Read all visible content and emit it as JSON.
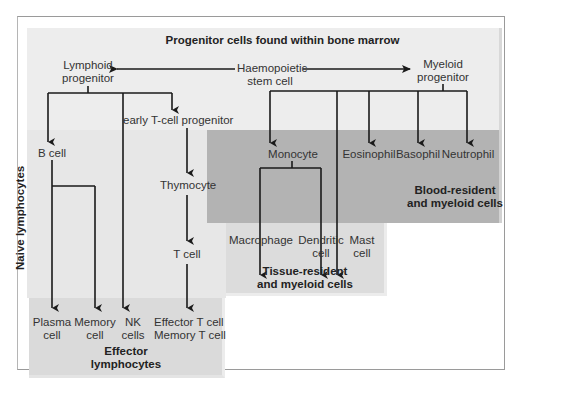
{
  "title": "Progenitor cells found within bone marrow",
  "nodes": {
    "stem_cell": "Haemopoietic\nstem cell",
    "stem_cell_l1": "Haemopoietic",
    "stem_cell_l2": "stem cell",
    "lymphoid_l1": "Lymphoid",
    "lymphoid_l2": "progenitor",
    "myeloid_l1": "Myeloid",
    "myeloid_l2": "progenitor",
    "early_t": "early T-cell progenitor",
    "b_cell": "B cell",
    "thymocyte": "Thymocyte",
    "t_cell": "T cell",
    "monocyte": "Monocyte",
    "eosinophil": "Eosinophil",
    "basophil": "Basophil",
    "neutrophil": "Neutrophil",
    "macrophage": "Macrophage",
    "dendritic_l1": "Dendritic",
    "dendritic_l2": "cell",
    "mast_l1": "Mast",
    "mast_l2": "cell",
    "plasma_l1": "Plasma",
    "plasma_l2": "cell",
    "memory_l1": "Memory",
    "memory_l2": "cell",
    "nk_l1": "NK",
    "nk_l2": "cells",
    "effector_t_l1": "Effector T cell",
    "effector_t_l2": "Memory T cell"
  },
  "regions": {
    "naive": "Naive lymphocytes",
    "blood_l1": "Blood-resident",
    "blood_l2": "and myeloid cells",
    "tissue_l1": "Tissue-resident",
    "tissue_l2": "and myeloid cells",
    "effector_l1": "Effector",
    "effector_l2": "lymphocytes"
  },
  "colors": {
    "marrow": "#ededed",
    "naive": "#e7e7e7",
    "blood": "#b3b3b3",
    "tissue": "#dcdcdc",
    "effector": "#dadada",
    "line": "#1a1a1a"
  }
}
